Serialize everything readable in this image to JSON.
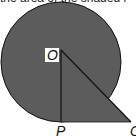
{
  "caption": "the area of the shaded r",
  "colors": {
    "shade": "#5c5c5c",
    "stroke": "#111111",
    "label_bg": "#ffffff"
  },
  "labels": {
    "center": "O",
    "foot": "P",
    "tip": "Q"
  },
  "geometry": {
    "circle": {
      "cx": 61,
      "cy": 62,
      "r": 60
    },
    "O": [
      61,
      50
    ],
    "P": [
      61,
      122
    ],
    "Q": [
      131,
      122
    ]
  }
}
